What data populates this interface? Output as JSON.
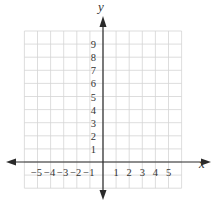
{
  "chart_data": {
    "type": "coordinate-grid",
    "title": "",
    "xlabel": "x",
    "ylabel": "y",
    "x_ticks": [
      "−5",
      "−4",
      "−3",
      "−2",
      "−1",
      "1",
      "2",
      "3",
      "4",
      "5"
    ],
    "x_tick_values": [
      -5,
      -4,
      -3,
      -2,
      -1,
      1,
      2,
      3,
      4,
      5
    ],
    "y_ticks": [
      "1",
      "2",
      "3",
      "4",
      "5",
      "6",
      "7",
      "8",
      "9"
    ],
    "y_tick_values": [
      1,
      2,
      3,
      4,
      5,
      6,
      7,
      8,
      9
    ],
    "grid_xlim": [
      -6,
      6
    ],
    "grid_ylim": [
      -2,
      10
    ],
    "grid": true,
    "series": []
  },
  "axes": {
    "x_label": "x",
    "y_label": "y"
  },
  "colors": {
    "grid": "#d4d4d4",
    "axis": "#2a2a2a",
    "text": "#333333",
    "background": "#ffffff"
  }
}
